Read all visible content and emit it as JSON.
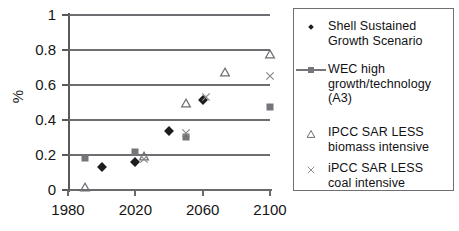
{
  "chart_data": {
    "type": "scatter",
    "title": "",
    "xlabel": "",
    "ylabel": "%",
    "xlim": [
      1980,
      2100
    ],
    "ylim": [
      0,
      1
    ],
    "xticks": [
      1980,
      2020,
      2060,
      2100
    ],
    "yticks": [
      0,
      0.2,
      0.4,
      0.6,
      0.8,
      1
    ],
    "xtick_labels": [
      "1980",
      "2020",
      "2060",
      "2100"
    ],
    "ytick_labels": [
      "0",
      "0.2",
      "0.4",
      "0.6",
      "0.8",
      "1"
    ],
    "grid": "horizontal",
    "legend_position": "right",
    "series": [
      {
        "name": "Shell Sustained Growth Scenario",
        "marker": "diamond",
        "color": "#1d1d1f",
        "points": [
          {
            "x": 2000,
            "y": 0.13
          },
          {
            "x": 2020,
            "y": 0.16
          },
          {
            "x": 2040,
            "y": 0.335
          },
          {
            "x": 2060,
            "y": 0.515
          }
        ]
      },
      {
        "name": "WEC high growth/technology (A3)",
        "marker": "square",
        "color": "#76767a",
        "points": [
          {
            "x": 1990,
            "y": 0.185
          },
          {
            "x": 2020,
            "y": 0.22
          },
          {
            "x": 2050,
            "y": 0.305
          },
          {
            "x": 2100,
            "y": 0.475
          }
        ]
      },
      {
        "name": "IPCC SAR LESS biomass intensive",
        "marker": "triangle",
        "color": "#6e6e72",
        "points": [
          {
            "x": 1990,
            "y": 0.02
          },
          {
            "x": 2025,
            "y": 0.195
          },
          {
            "x": 2050,
            "y": 0.495
          },
          {
            "x": 2073,
            "y": 0.675
          },
          {
            "x": 2100,
            "y": 0.78
          }
        ]
      },
      {
        "name": "iPCC SAR LESS coal intensive",
        "marker": "cross",
        "color": "#8a8a8e",
        "points": [
          {
            "x": 2025,
            "y": 0.18
          },
          {
            "x": 2050,
            "y": 0.325
          },
          {
            "x": 2062,
            "y": 0.53
          },
          {
            "x": 2100,
            "y": 0.65
          }
        ]
      }
    ]
  },
  "axis": {
    "y_label": "%"
  },
  "legend": {
    "entries": [
      {
        "marker": "diamond-marker",
        "line1": "Shell Sustained",
        "line2": "Growth Scenario",
        "line3": "",
        "line4": ""
      },
      {
        "marker": "square-line-marker",
        "line1": "WEC high",
        "line2": "growth/technology",
        "line3": "(A3)",
        "line4": ""
      },
      {
        "marker": "triangle-marker",
        "line1": "IPCC SAR LESS",
        "line2": "biomass intensive",
        "line3": "",
        "line4": ""
      },
      {
        "marker": "cross-marker",
        "line1": "iPCC SAR LESS",
        "line2": "coal intensive",
        "line3": "",
        "line4": ""
      }
    ]
  }
}
